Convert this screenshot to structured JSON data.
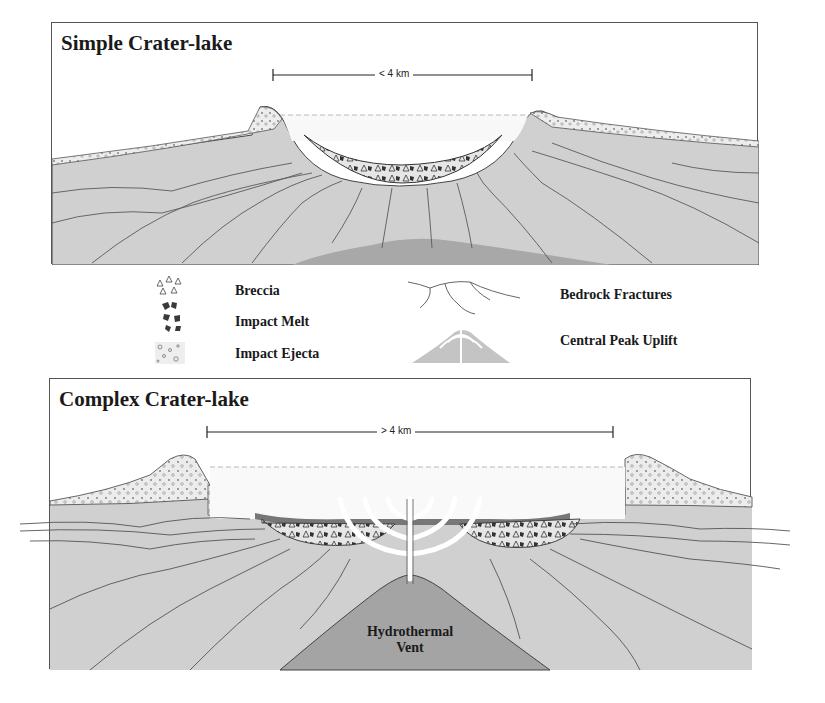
{
  "simple_panel": {
    "title": "Simple Crater-lake",
    "scale_label": "< 4 km"
  },
  "complex_panel": {
    "title": "Complex Crater-lake",
    "scale_label": "> 4 km",
    "vent_label_line1": "Hydrothermal",
    "vent_label_line2": "Vent"
  },
  "legend": {
    "items": [
      {
        "label": "Breccia",
        "icon": "breccia-icon"
      },
      {
        "label": "Impact Melt",
        "icon": "impact-melt-icon"
      },
      {
        "label": "Impact Ejecta",
        "icon": "impact-ejecta-icon"
      },
      {
        "label": "Bedrock Fractures",
        "icon": "bedrock-fractures-icon"
      },
      {
        "label": "Central Peak Uplift",
        "icon": "central-peak-uplift-icon"
      }
    ]
  },
  "colors": {
    "bedrock": "#cfcfcf",
    "deep_body": "#a9a9a9",
    "fracture": "#555555",
    "ejecta": "#ececec",
    "frame": "#555555"
  }
}
